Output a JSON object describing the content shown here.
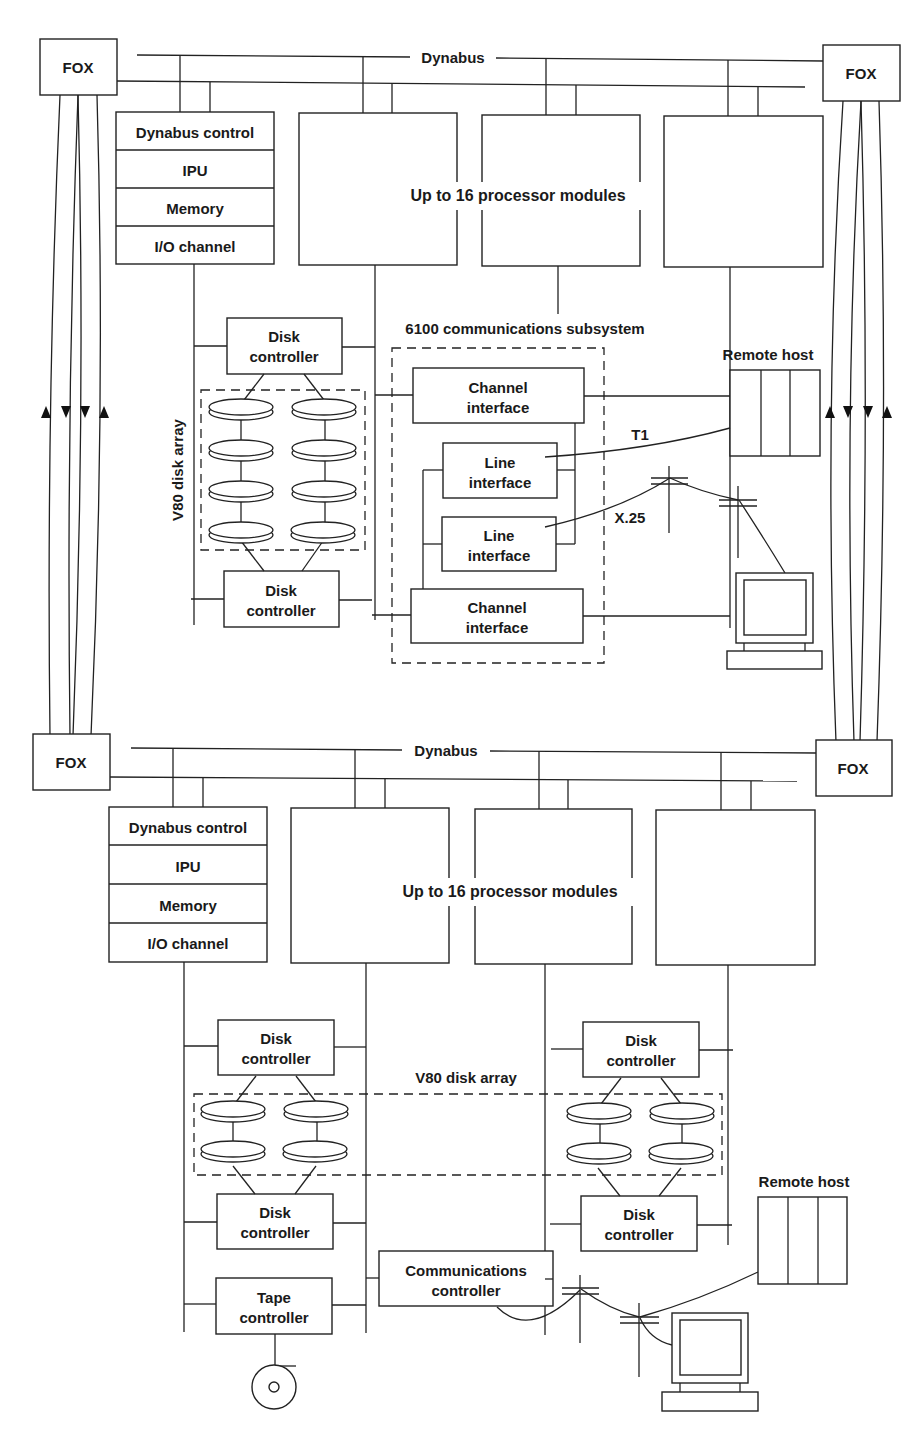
{
  "figure": {
    "top_system": {
      "bus_label": "Dynabus",
      "fox_left": "FOX",
      "fox_right": "FOX",
      "module_stack": [
        "Dynabus control",
        "IPU",
        "Memory",
        "I/O channel"
      ],
      "processor_label": "Up to 16 processor modules",
      "disk_array_label": "V80 disk array",
      "disk_controller_top": [
        "Disk",
        "controller"
      ],
      "disk_controller_bottom": [
        "Disk",
        "controller"
      ],
      "comm_subsystem_label": "6100 communications subsystem",
      "channel_interface_top": [
        "Channel",
        "interface"
      ],
      "line_interface_1": [
        "Line",
        "interface"
      ],
      "line_interface_2": [
        "Line",
        "interface"
      ],
      "channel_interface_bottom": [
        "Channel",
        "interface"
      ],
      "remote_host_label": "Remote host",
      "link_t1": "T1",
      "link_x25": "X.25",
      "disk_count": 8
    },
    "bottom_system": {
      "bus_label": "Dynabus",
      "fox_left": "FOX",
      "fox_right": "FOX",
      "module_stack": [
        "Dynabus control",
        "IPU",
        "Memory",
        "I/O channel"
      ],
      "processor_label": "Up to 16 processor modules",
      "disk_array_label": "V80 disk array",
      "left_disk_controller_top": [
        "Disk",
        "controller"
      ],
      "left_disk_controller_bottom": [
        "Disk",
        "controller"
      ],
      "right_disk_controller_top": [
        "Disk",
        "controller"
      ],
      "right_disk_controller_bottom": [
        "Disk",
        "controller"
      ],
      "tape_controller": [
        "Tape",
        "controller"
      ],
      "communications_controller": [
        "Communications",
        "controller"
      ],
      "remote_host_label": "Remote host",
      "disk_count": 8
    },
    "fox_link_arrows": [
      "up",
      "down",
      "down",
      "up"
    ]
  }
}
